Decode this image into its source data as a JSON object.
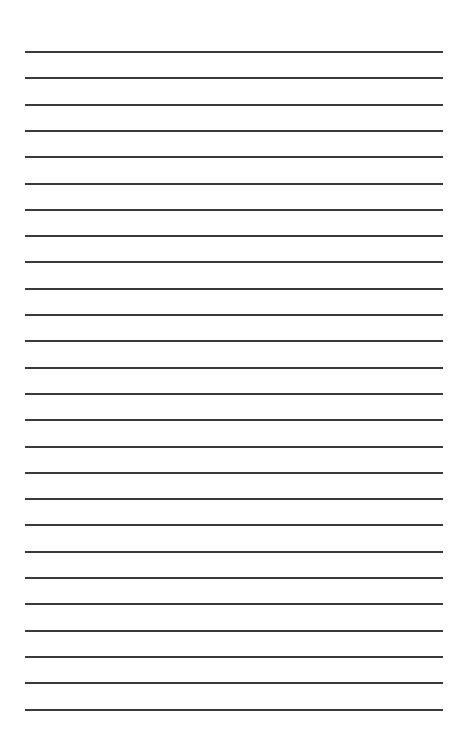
{
  "page": {
    "type": "lined-paper",
    "background_color": "#ffffff",
    "line_color": "#3a3a3a",
    "line_count": 26,
    "line_left": 25,
    "line_width": 418,
    "first_line_y": 51,
    "line_spacing": 26.3
  }
}
